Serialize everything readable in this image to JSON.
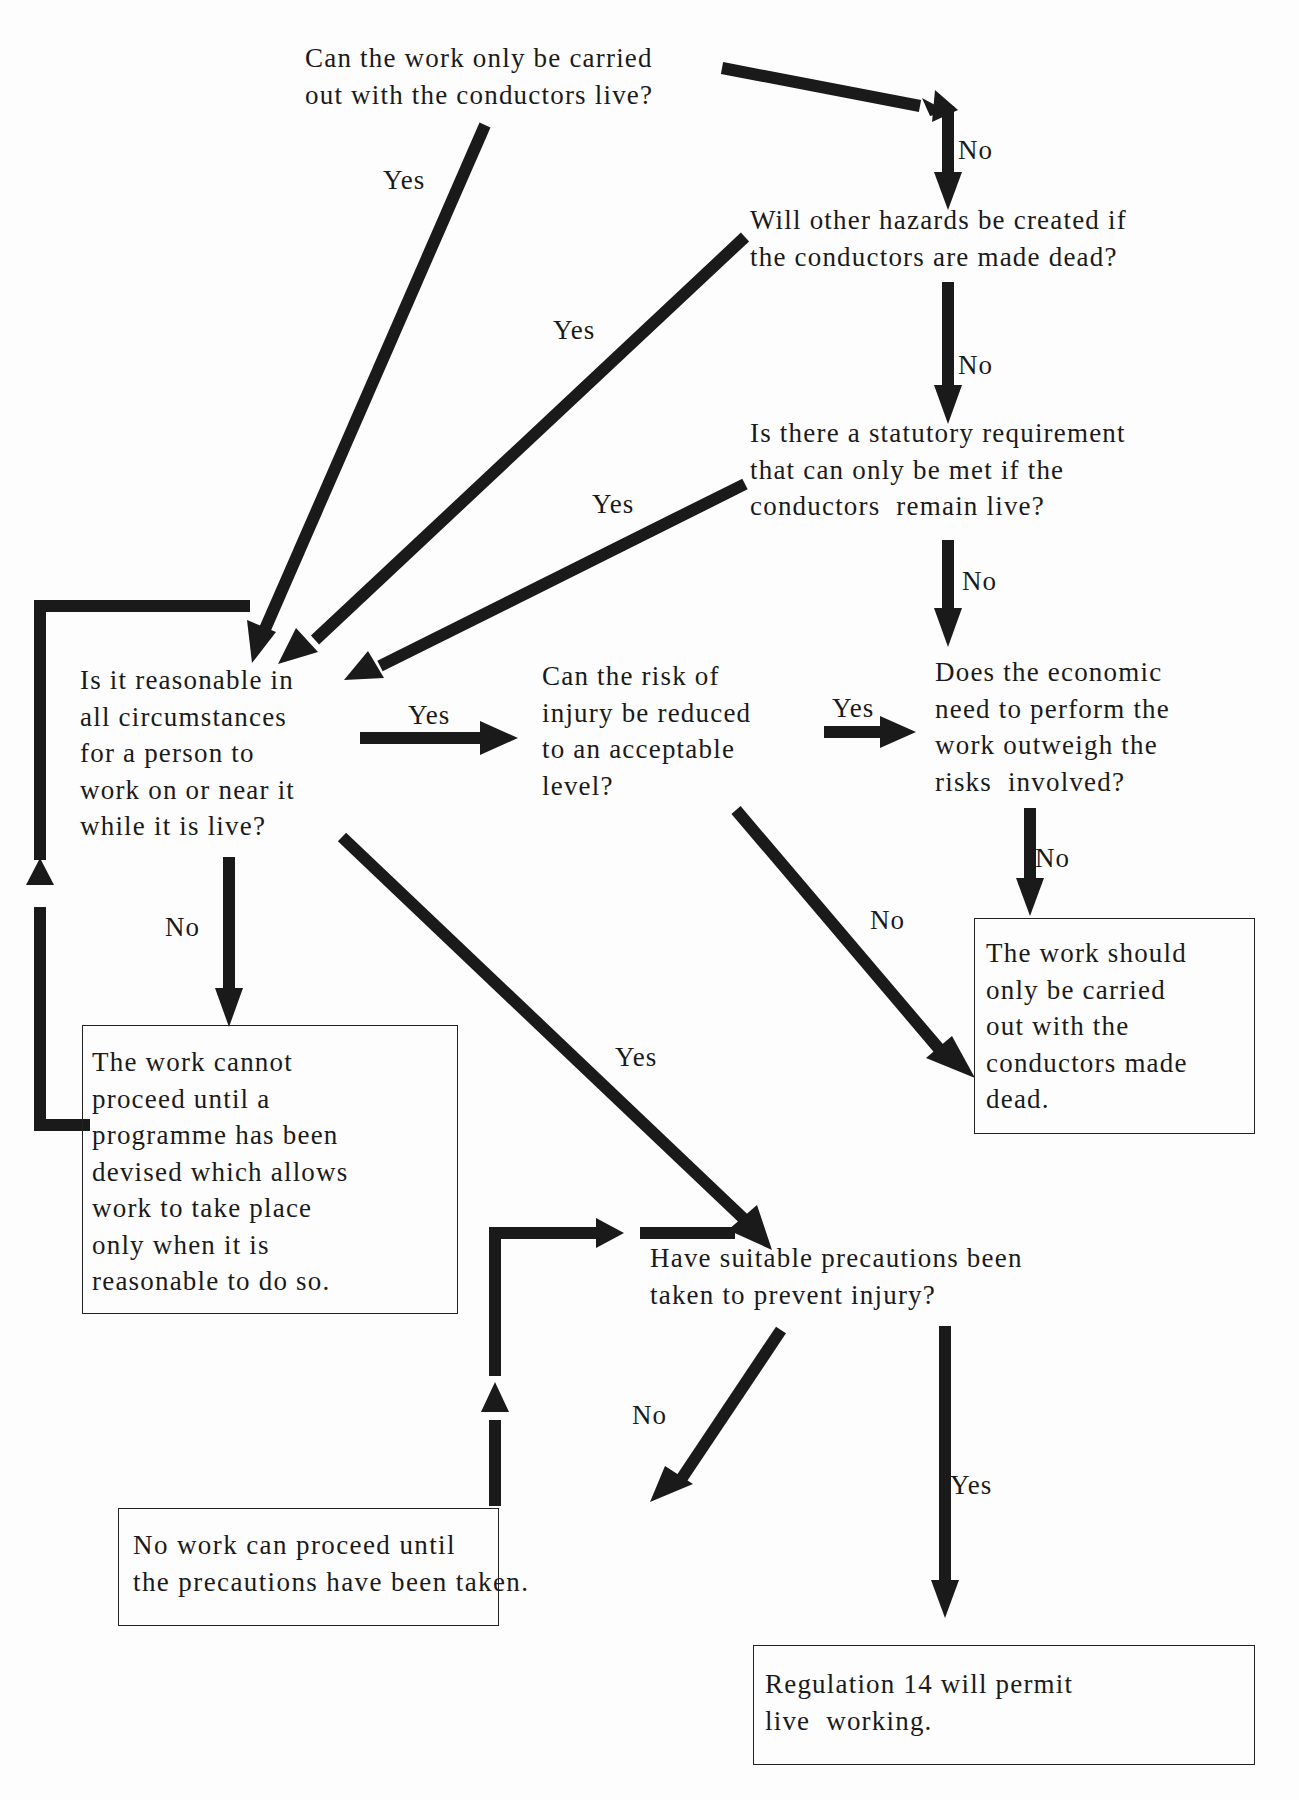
{
  "diagram": {
    "type": "flowchart",
    "colors": {
      "ink": "#1a1a1a",
      "background": "#fdfdfd"
    },
    "nodes": {
      "q_only_live": {
        "kind": "question",
        "text": "Can the work only be carried\nout with the conductors live?"
      },
      "q_other_hazards": {
        "kind": "question",
        "text": "Will other hazards be created if\nthe conductors are made dead?"
      },
      "q_statutory": {
        "kind": "question",
        "text": "Is there a statutory requirement\nthat can only be met if the\nconductors  remain live?"
      },
      "q_reasonable": {
        "kind": "question",
        "text": "Is it reasonable in\nall circumstances\nfor a person to\nwork on or near it\nwhile it is live?"
      },
      "q_reduce_risk": {
        "kind": "question",
        "text": "Can the risk of\ninjury be reduced\nto an acceptable\nlevel?"
      },
      "q_economic": {
        "kind": "question",
        "text": "Does the economic\nneed to perform the\nwork outweigh the\nrisks  involved?"
      },
      "r_dead": {
        "kind": "outcome",
        "text": "The work should\nonly be carried\nout with the\nconductors made\ndead."
      },
      "r_cannot_proceed": {
        "kind": "outcome",
        "text": "The work cannot\nproceed until a\nprogramme has been\ndevised which allows\nwork to take place\nonly when it is\nreasonable to do so."
      },
      "q_precautions": {
        "kind": "question",
        "text": "Have suitable precautions been\ntaken to prevent injury?"
      },
      "r_no_work": {
        "kind": "outcome",
        "text": "No work can proceed until\nthe precautions have been taken."
      },
      "r_regulation": {
        "kind": "outcome",
        "text": "Regulation 14 will permit\nlive  working."
      }
    },
    "edges": [
      {
        "from": "q_only_live",
        "to": "q_other_hazards",
        "label": "No"
      },
      {
        "from": "q_only_live",
        "to": "q_reasonable",
        "label": "Yes"
      },
      {
        "from": "q_other_hazards",
        "to": "q_statutory",
        "label": "No"
      },
      {
        "from": "q_other_hazards",
        "to": "q_reasonable",
        "label": "Yes"
      },
      {
        "from": "q_statutory",
        "to": "q_economic",
        "label": "No"
      },
      {
        "from": "q_statutory",
        "to": "q_reasonable",
        "label": "Yes"
      },
      {
        "from": "q_reasonable",
        "to": "q_reduce_risk",
        "label": "Yes"
      },
      {
        "from": "q_reasonable",
        "to": "r_cannot_proceed",
        "label": "No"
      },
      {
        "from": "q_reasonable",
        "to": "q_precautions",
        "label": "Yes"
      },
      {
        "from": "q_reduce_risk",
        "to": "q_economic",
        "label": "Yes"
      },
      {
        "from": "q_reduce_risk",
        "to": "r_dead",
        "label": "No"
      },
      {
        "from": "q_economic",
        "to": "r_dead",
        "label": "No"
      },
      {
        "from": "r_cannot_proceed",
        "to": "q_reasonable",
        "label": ""
      },
      {
        "from": "q_precautions",
        "to": "r_no_work",
        "label": "No"
      },
      {
        "from": "q_precautions",
        "to": "r_regulation",
        "label": "Yes"
      },
      {
        "from": "r_no_work",
        "to": "q_precautions",
        "label": ""
      }
    ],
    "edge_labels": {
      "only_live_no": "No",
      "only_live_yes": "Yes",
      "other_hazards_no": "No",
      "other_hazards_yes": "Yes",
      "statutory_no": "No",
      "statutory_yes": "Yes",
      "reasonable_yes_right": "Yes",
      "reasonable_no": "No",
      "reasonable_yes_down": "Yes",
      "reduce_risk_yes": "Yes",
      "reduce_risk_no": "No",
      "economic_no": "No",
      "precautions_no": "No",
      "precautions_yes": "Yes"
    }
  }
}
